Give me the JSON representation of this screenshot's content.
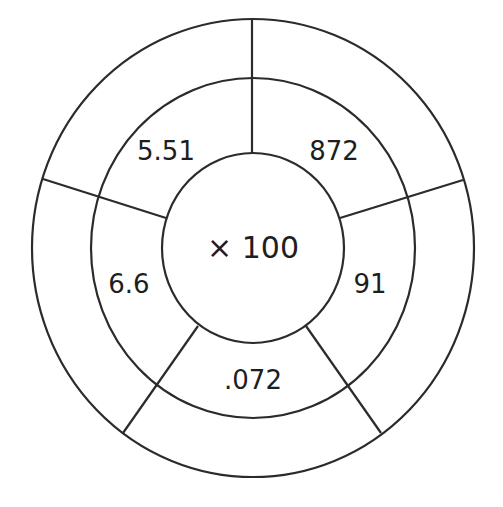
{
  "diagram": {
    "type": "multiplication-wheel",
    "center_operation": "× 100",
    "inner_ring_numbers": [
      {
        "position": "upper-left",
        "value": "5.51"
      },
      {
        "position": "upper-right",
        "value": "872"
      },
      {
        "position": "right",
        "value": "91"
      },
      {
        "position": "bottom",
        "value": ".072"
      },
      {
        "position": "left",
        "value": "6.6"
      }
    ],
    "outer_ring_answers": [
      "",
      "",
      "",
      "",
      ""
    ],
    "colors": {
      "stroke": "#2b2b2b",
      "text": "#1e1e1e",
      "background": "#ffffff"
    }
  }
}
